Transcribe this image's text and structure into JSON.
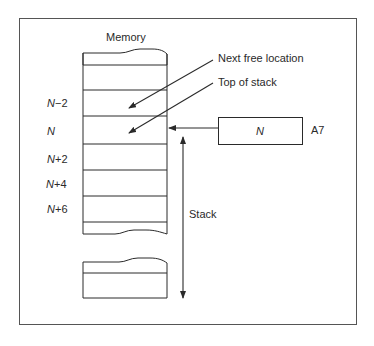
{
  "title": "Memory",
  "callouts": {
    "next_free": "Next free location",
    "top_of_stack": "Top of stack"
  },
  "addresses": [
    {
      "label": "N",
      "op": "−",
      "num": "2"
    },
    {
      "label": "N",
      "op": "",
      "num": ""
    },
    {
      "label": "N",
      "op": "+",
      "num": "2"
    },
    {
      "label": "N",
      "op": "+",
      "num": "4"
    },
    {
      "label": "N",
      "op": "+",
      "num": "6"
    }
  ],
  "register": {
    "value": "N",
    "name": "A7"
  },
  "stack_label": "Stack",
  "colors": {
    "line": "#2a2a2a",
    "background": "#ffffff"
  }
}
